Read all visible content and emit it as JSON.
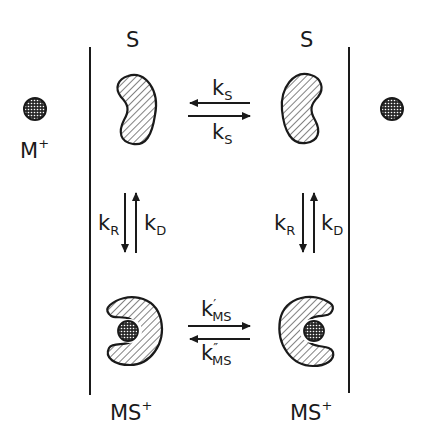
{
  "diagram": {
    "type": "ion-transport-scheme",
    "membranes": [
      {
        "name": "left-membrane",
        "x": 90
      },
      {
        "name": "right-membrane",
        "x": 349
      }
    ],
    "labels": {
      "substrate_left": "S",
      "substrate_right": "S",
      "ion_left": "M",
      "ion_left_charge": "+",
      "complex_left": "MS",
      "complex_left_charge": "+",
      "complex_right": "MS",
      "complex_right_charge": "+"
    },
    "rates": {
      "ks_top": {
        "k": "k",
        "sub": "S"
      },
      "ks_bottom": {
        "k": "k",
        "sub": "S"
      },
      "kR_left": {
        "k": "k",
        "sub": "R"
      },
      "kD_left": {
        "k": "k",
        "sub": "D"
      },
      "kR_right": {
        "k": "k",
        "sub": "R"
      },
      "kD_right": {
        "k": "k",
        "sub": "D"
      },
      "kms_forward": {
        "k": "k",
        "prime": "′",
        "sub": "MS"
      },
      "kms_reverse": {
        "k": "k",
        "prime": "″",
        "sub": "MS"
      }
    },
    "colors": {
      "ink": "#1a1a1a",
      "background": "#ffffff"
    }
  }
}
